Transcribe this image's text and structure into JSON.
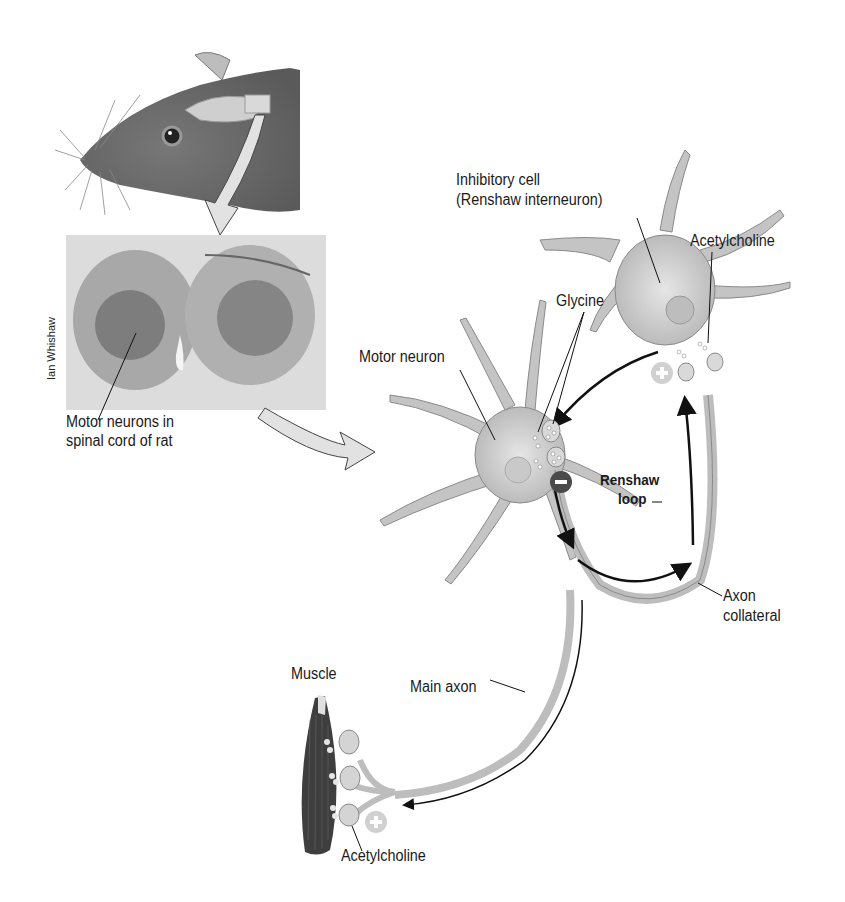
{
  "figure": {
    "credit": "Ian Whishaw",
    "labels": {
      "spinal_cord": [
        "Motor neurons in",
        "spinal cord of rat"
      ],
      "inhibitory_cell": [
        "Inhibitory cell",
        "(Renshaw interneuron)"
      ],
      "acetylcholine_top": "Acetylcholine",
      "glycine": "Glycine",
      "motor_neuron": "Motor neuron",
      "renshaw_loop": [
        "Renshaw",
        "loop"
      ],
      "axon_collateral": [
        "Axon",
        "collateral"
      ],
      "muscle": "Muscle",
      "main_axon": "Main axon",
      "acetylcholine_bottom": "Acetylcholine"
    },
    "symbols": {
      "inhibitory_synapse": "−",
      "excitatory_synapse_top": "+",
      "excitatory_synapse_bottom": "+"
    },
    "colors": {
      "neuron_fill": "#c9c9c9",
      "neuron_edge": "#8a8a8a",
      "arrow_fill": "#e2e2e2",
      "inhibit_circle": "#4a4a4a",
      "excite_circle": "#cfcfcf",
      "muscle": "#3a3a3a",
      "rat": "#6b6b6b",
      "section_bg": "#d8d8d8"
    }
  }
}
